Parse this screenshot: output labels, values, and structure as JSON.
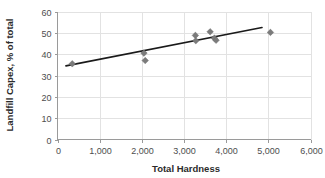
{
  "chart_data": {
    "type": "scatter",
    "title": "",
    "xlabel": "Total Hardness",
    "ylabel": "Landfill Capex, % of total",
    "xlim": [
      0,
      6000
    ],
    "ylim": [
      0,
      60
    ],
    "xticks": [
      0,
      1000,
      2000,
      3000,
      4000,
      5000,
      6000
    ],
    "xtick_labels": [
      "0",
      "1,000",
      "2,000",
      "3,000",
      "4,000",
      "5,000",
      "6,000"
    ],
    "yticks": [
      0,
      10,
      20,
      30,
      40,
      50,
      60
    ],
    "ytick_labels": [
      "0",
      "10",
      "20",
      "30",
      "40",
      "50",
      "60"
    ],
    "grid": true,
    "grid_axis": "both",
    "legend": false,
    "marker_shape": "diamond",
    "marker_color": "#7b7b7b",
    "trendline_color": "#1a1a1a",
    "points": [
      {
        "x": 350,
        "y": 35.5
      },
      {
        "x": 2050,
        "y": 40.5
      },
      {
        "x": 2080,
        "y": 37.0
      },
      {
        "x": 3270,
        "y": 48.8
      },
      {
        "x": 3280,
        "y": 46.3
      },
      {
        "x": 3620,
        "y": 50.5
      },
      {
        "x": 3720,
        "y": 47.5
      },
      {
        "x": 3760,
        "y": 46.5
      },
      {
        "x": 5050,
        "y": 50.2
      }
    ],
    "trendline": {
      "type": "linear",
      "x_start": 200,
      "y_start": 34.5,
      "x_end": 4850,
      "y_end": 52.5
    }
  }
}
